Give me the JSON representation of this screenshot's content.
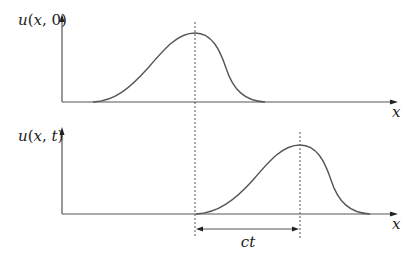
{
  "figure": {
    "type": "traveling wave diagram",
    "top_plot": {
      "y_label": "u(x,0)",
      "x_label": "x",
      "peak_x": 195
    },
    "bottom_plot": {
      "y_label": "u(x,t)",
      "x_label": "x",
      "peak_x": 300
    },
    "shift_label": "ct",
    "colors": {
      "stroke": "#555555",
      "text": "#222222",
      "background": "#ffffff"
    }
  }
}
